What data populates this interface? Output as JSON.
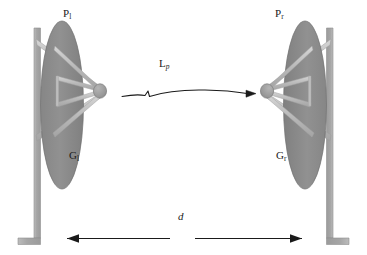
{
  "figure": {
    "type": "diagram",
    "background_color": "#ffffff",
    "ink_color": "#1a1a1a",
    "dish_fill": "#8f8f8f",
    "dish_stroke": "#6e6e6e",
    "mast_fill": "#a8a8a8",
    "mast_stroke": "#8a8a8a",
    "strut_fill": "#c2c2c2",
    "feed_fill": "#9a9a9a"
  },
  "labels": {
    "left_power": {
      "base": "P",
      "sub": "l",
      "full": "P_l"
    },
    "right_power": {
      "base": "P",
      "sub": "r",
      "full": "P_r"
    },
    "left_gain": {
      "base": "G",
      "sub": "l",
      "full": "G_l"
    },
    "right_gain": {
      "base": "G",
      "sub": "r",
      "full": "G_r"
    },
    "path_loss": {
      "base": "L",
      "sub": "p",
      "full": "L_p"
    },
    "distance": {
      "base": "d",
      "sub": "",
      "full": "d"
    }
  },
  "annotations": {
    "propagation_arrow": "left-to-right wavy signal path with arrowhead",
    "distance_dimension": "double-headed horizontal dimension line broken at center for label d"
  }
}
